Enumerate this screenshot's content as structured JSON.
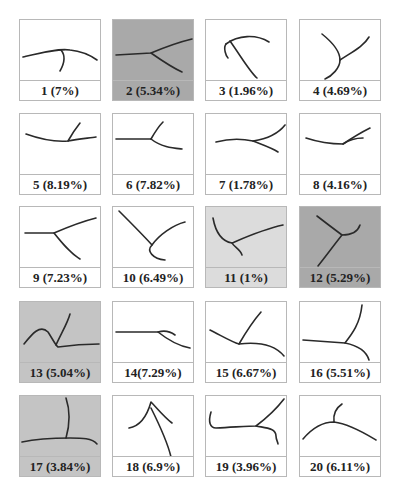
{
  "figure": {
    "cells": [
      {
        "index": 1,
        "label": "1 (7%)",
        "number": 1,
        "percent": "7%",
        "background": "white",
        "shape": "root-branch"
      },
      {
        "index": 2,
        "label": "2 (5.34%)",
        "number": 2,
        "percent": "5.34%",
        "background": "dark-gray",
        "shape": "root-branch"
      },
      {
        "index": 3,
        "label": "3 (1.96%)",
        "number": 3,
        "percent": "1.96%",
        "background": "white",
        "shape": "root-branch"
      },
      {
        "index": 4,
        "label": "4 (4.69%)",
        "number": 4,
        "percent": "4.69%",
        "background": "white",
        "shape": "root-branch"
      },
      {
        "index": 5,
        "label": "5 (8.19%)",
        "number": 5,
        "percent": "8.19%",
        "background": "white",
        "shape": "root-branch"
      },
      {
        "index": 6,
        "label": "6 (7.82%)",
        "number": 6,
        "percent": "7.82%",
        "background": "white",
        "shape": "root-branch"
      },
      {
        "index": 7,
        "label": "7 (1.78%)",
        "number": 7,
        "percent": "1.78%",
        "background": "white",
        "shape": "root-branch"
      },
      {
        "index": 8,
        "label": "8 (4.16%)",
        "number": 8,
        "percent": "4.16%",
        "background": "white",
        "shape": "root-branch"
      },
      {
        "index": 9,
        "label": "9 (7.23%)",
        "number": 9,
        "percent": "7.23%",
        "background": "white",
        "shape": "root-branch"
      },
      {
        "index": 10,
        "label": "10 (6.49%)",
        "number": 10,
        "percent": "6.49%",
        "background": "white",
        "shape": "root-branch"
      },
      {
        "index": 11,
        "label": "11 (1%)",
        "number": 11,
        "percent": "1%",
        "background": "light-gray",
        "shape": "root-branch"
      },
      {
        "index": 12,
        "label": "12 (5.29%)",
        "number": 12,
        "percent": "5.29%",
        "background": "dark-gray",
        "shape": "root-branch"
      },
      {
        "index": 13,
        "label": "13 (5.04%)",
        "number": 13,
        "percent": "5.04%",
        "background": "mid-gray",
        "shape": "root-branch"
      },
      {
        "index": 14,
        "label": "14(7.29%)",
        "number": 14,
        "percent": "7.29%",
        "background": "white",
        "shape": "root-branch"
      },
      {
        "index": 15,
        "label": "15 (6.67%)",
        "number": 15,
        "percent": "6.67%",
        "background": "white",
        "shape": "root-branch"
      },
      {
        "index": 16,
        "label": "16 (5.51%)",
        "number": 16,
        "percent": "5.51%",
        "background": "white",
        "shape": "root-branch"
      },
      {
        "index": 17,
        "label": "17 (3.84%)",
        "number": 17,
        "percent": "3.84%",
        "background": "mid-gray",
        "shape": "root-branch"
      },
      {
        "index": 18,
        "label": "18 (6.9%)",
        "number": 18,
        "percent": "6.9%",
        "background": "white",
        "shape": "root-branch"
      },
      {
        "index": 19,
        "label": "19 (3.96%)",
        "number": 19,
        "percent": "3.96%",
        "background": "white",
        "shape": "root-branch"
      },
      {
        "index": 20,
        "label": "20 (6.11%)",
        "number": 20,
        "percent": "6.11%",
        "background": "white",
        "shape": "root-branch"
      }
    ],
    "colors": {
      "border": "#b8b8b8",
      "stroke": "#2a2a2a",
      "white": "#ffffff",
      "light-gray": "#dcdcdc",
      "mid-gray": "#c4c4c4",
      "dark-gray": "#a9a9a9"
    },
    "layout": {
      "columns": 4,
      "rows": 5
    }
  }
}
